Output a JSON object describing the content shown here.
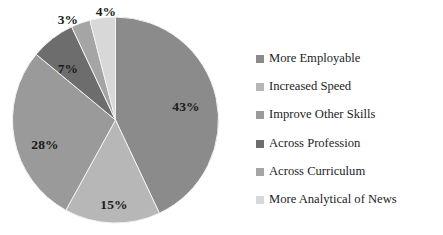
{
  "chart_data": {
    "type": "pie",
    "title": "",
    "categories": [
      "More Employable",
      "Increased Speed",
      "Improve Other Skills",
      "Across Profession",
      "Across Curriculum",
      "More Analytical of News"
    ],
    "values": [
      43,
      15,
      28,
      7,
      3,
      4
    ],
    "value_labels": [
      "43%",
      "15%",
      "28%",
      "7%",
      "3%",
      "4%"
    ],
    "unit": "%",
    "start_angle_deg": 0,
    "direction": "clockwise",
    "legend_position": "right",
    "grid": false,
    "background_color": "#ffffff",
    "colors": [
      "#8b8b8b",
      "#b7b7b7",
      "#9a9a9a",
      "#6d6d6d",
      "#a5a5a5",
      "#d8d8d8"
    ],
    "slice_label_positions": [
      {
        "label": "43%",
        "x": 186,
        "y": 107
      },
      {
        "label": "15%",
        "x": 114,
        "y": 205
      },
      {
        "label": "28%",
        "x": 45,
        "y": 145
      },
      {
        "label": "7%",
        "x": 68,
        "y": 69
      },
      {
        "label": "3%",
        "x": 68,
        "y": 20
      },
      {
        "label": "4%",
        "x": 106,
        "y": 12
      }
    ]
  },
  "legend": {
    "items": [
      {
        "label": "More Employable",
        "color": "#8b8b8b"
      },
      {
        "label": "Increased Speed",
        "color": "#b7b7b7"
      },
      {
        "label": "Improve Other Skills",
        "color": "#9a9a9a"
      },
      {
        "label": "Across Profession",
        "color": "#6d6d6d"
      },
      {
        "label": "Across Curriculum",
        "color": "#a5a5a5"
      },
      {
        "label": "More Analytical of News",
        "color": "#d8d8d8"
      }
    ]
  }
}
